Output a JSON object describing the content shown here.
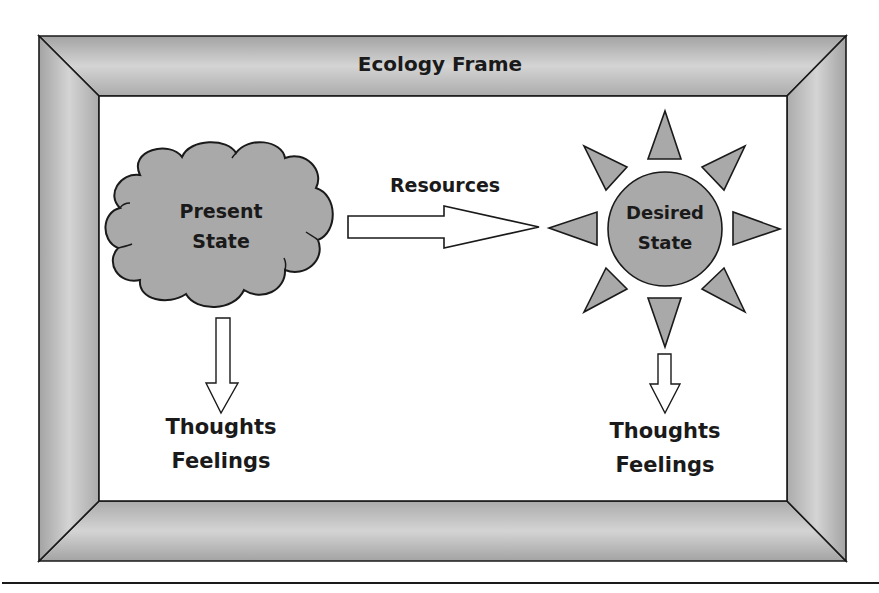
{
  "diagram": {
    "title": "Ecology Frame",
    "present_state": {
      "line1": "Present",
      "line2": "State"
    },
    "desired_state": {
      "line1": "Desired",
      "line2": "State"
    },
    "connector_label": "Resources",
    "present_outcomes": {
      "line1": "Thoughts",
      "line2": "Feelings"
    },
    "desired_outcomes": {
      "line1": "Thoughts",
      "line2": "Feelings"
    }
  },
  "colors": {
    "shape_fill": "#a9a9a9",
    "frame_light": "#d6d6d6",
    "frame_dark": "#9e9e9e",
    "stroke": "#1a1a1a",
    "background": "#ffffff"
  },
  "icons": {
    "present_shape": "cloud-icon",
    "desired_shape": "sun-icon",
    "connector": "block-arrow-right-icon",
    "outcome_arrows": "block-arrow-down-icon"
  }
}
